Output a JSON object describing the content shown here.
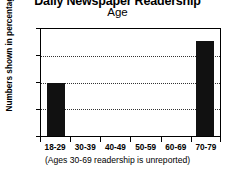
{
  "chart_data": {
    "type": "bar",
    "title": "Daily Newspaper Readership",
    "subtitle": "Age",
    "xlabel": "",
    "ylabel": "Numbers shown in percentages",
    "caption": "(Ages 30-69 readership is unreported)",
    "categories": [
      "18-29",
      "30-39",
      "40-49",
      "50-59",
      "60-69",
      "70-79"
    ],
    "values": [
      40,
      null,
      null,
      null,
      null,
      71
    ],
    "ylim": [
      0,
      80
    ],
    "yticks": [
      0,
      20,
      40,
      60,
      80
    ],
    "ytick_labels": [
      "0",
      "20",
      "40",
      "60",
      "80"
    ],
    "grid": true,
    "grid_style": "dotted",
    "legend": false,
    "bar_color": "#111111",
    "background_color": "#ffffff",
    "axis_color": "#000000"
  },
  "axis": {
    "y_tick_0": "0",
    "y_tick_1": "20",
    "y_tick_2": "40",
    "y_tick_3": "60",
    "y_tick_4": "80",
    "x_cat_0": "18-29",
    "x_cat_1": "30-39",
    "x_cat_2": "40-49",
    "x_cat_3": "50-59",
    "x_cat_4": "60-69",
    "x_cat_5": "70-79"
  }
}
